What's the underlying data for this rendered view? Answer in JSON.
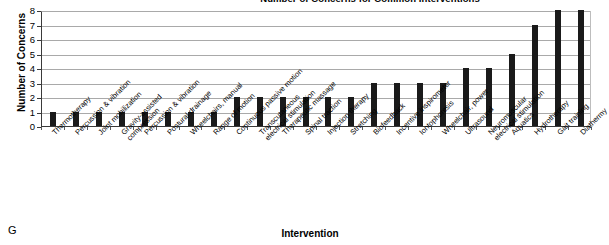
{
  "figure": {
    "panel_letter": "G"
  },
  "chart_data": {
    "type": "bar",
    "title": "Number of Concerns for Common Interventions",
    "xlabel": "Intervention",
    "ylabel": "Number of Concerns",
    "ylim": [
      0,
      8
    ],
    "y_ticks": [
      0,
      1,
      2,
      3,
      4,
      5,
      6,
      7,
      8
    ],
    "grid": true,
    "legend": "none",
    "bar_color": "#1a1a1a",
    "categories": [
      "Thermotherapy",
      "Percussion & vibration",
      "Joint mobilization",
      "Gravity-assisted compression",
      "Percussion & vibration",
      "Postural drainage",
      "Wheelchairs, manual",
      "Range of motion",
      "Continuous passive motion",
      "Transcutaneous electrical stimulation",
      "Therapeutic massage",
      "Spinal traction",
      "Injection therapy",
      "Stretching",
      "Biofeedback",
      "Incentive inspirometer",
      "Iontophoresis",
      "Wheelchair, power",
      "Ultrasound",
      "Neuromuscular electrical stimulation",
      "Aquatics",
      "Hydrotherapy",
      "Gait training",
      "Diathermy"
    ],
    "values": [
      1,
      1,
      1,
      1,
      1,
      1,
      1,
      1,
      2,
      2,
      2,
      2,
      2,
      2,
      3,
      3,
      3,
      3,
      4,
      4,
      5,
      7,
      8,
      8
    ]
  }
}
